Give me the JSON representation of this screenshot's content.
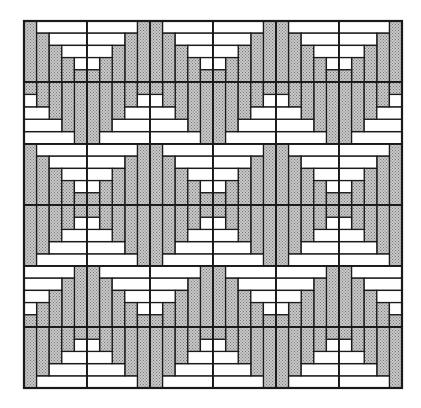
{
  "figure": {
    "canvas": {
      "width": 421,
      "height": 408
    },
    "grid": {
      "left": 24,
      "top": 21,
      "right": 402,
      "bottom": 388,
      "cols": 6,
      "rows": 6,
      "col_edges": [
        24,
        87,
        150,
        213,
        276,
        339,
        402
      ],
      "row_edges": [
        21,
        82,
        144,
        205,
        266,
        327,
        388
      ],
      "logs_per_block": 5
    },
    "colors": {
      "background": "#ffffff",
      "gray_log": "#bdbdbd",
      "gray_dot": "#8a8a8a",
      "white_log": "#ffffff",
      "outline": "#1a1a1a"
    },
    "block_center_corners": [
      [
        "BR",
        "BL",
        "BR",
        "BL",
        "BR",
        "BL"
      ],
      [
        "TL",
        "TR",
        "TL",
        "TR",
        "TL",
        "TR"
      ],
      [
        "BR",
        "BL",
        "BR",
        "BL",
        "BR",
        "BL"
      ],
      [
        "TR",
        "TL",
        "TR",
        "TL",
        "TR",
        "TL"
      ],
      [
        "BL",
        "BR",
        "BL",
        "BR",
        "BL",
        "BR"
      ],
      [
        "TR",
        "TL",
        "TR",
        "TL",
        "TR",
        "TL"
      ]
    ],
    "legend": {
      "gray": "vertical logs and center square",
      "white": "horizontal logs"
    }
  }
}
